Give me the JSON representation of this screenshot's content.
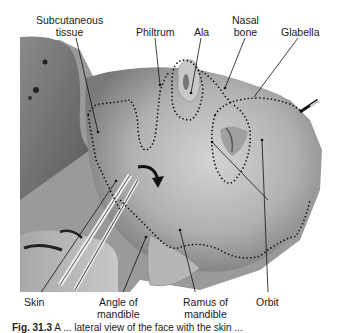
{
  "figure": {
    "labels_top": [
      {
        "id": "subcutaneous-tissue",
        "line1": "Subcutaneous",
        "line2": "tissue"
      },
      {
        "id": "philtrum",
        "line1": "Philtrum",
        "line2": ""
      },
      {
        "id": "ala",
        "line1": "Ala",
        "line2": ""
      },
      {
        "id": "nasal-bone",
        "line1": "Nasal",
        "line2": "bone"
      },
      {
        "id": "glabella",
        "line1": "Glabella",
        "line2": ""
      }
    ],
    "labels_bottom": [
      {
        "id": "skin",
        "line1": "Skin",
        "line2": ""
      },
      {
        "id": "angle-of-mandible",
        "line1": "Angle of",
        "line2": "mandible"
      },
      {
        "id": "ramus-of-mandible",
        "line1": "Ramus of",
        "line2": "mandible"
      },
      {
        "id": "orbit",
        "line1": "Orbit",
        "line2": ""
      }
    ],
    "caption": {
      "number": "Fig. 31.3",
      "text": "A ... lateral view of the face with the skin ..."
    }
  }
}
